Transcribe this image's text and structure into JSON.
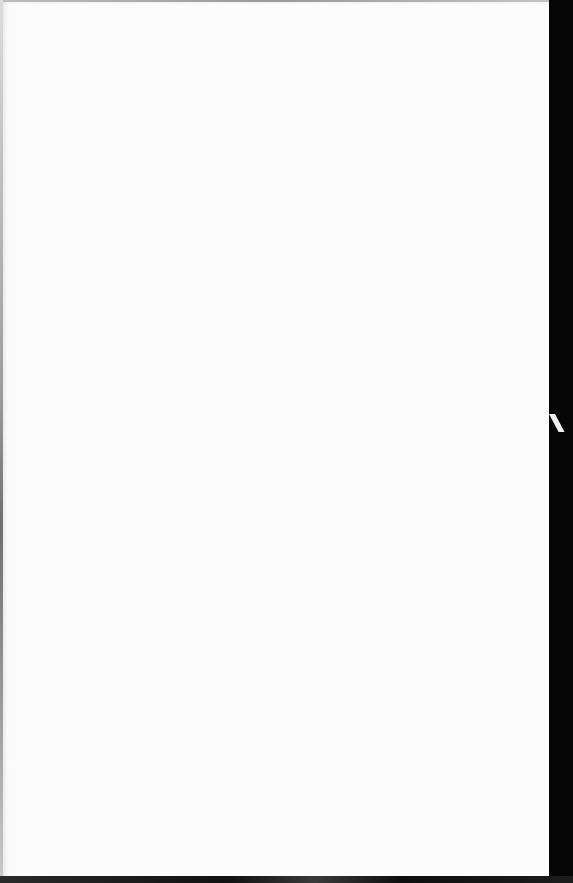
{
  "document": {
    "type": "blank-page",
    "text": "",
    "colors": {
      "paper": "#fefefe",
      "background": "#050505",
      "edge_shadow": "#9c9c9c"
    }
  }
}
